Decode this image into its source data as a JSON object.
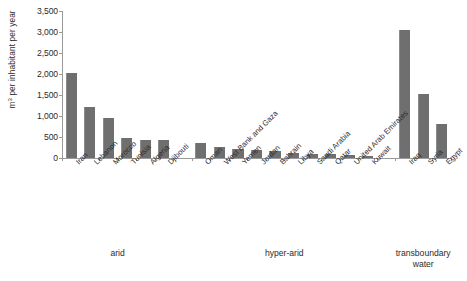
{
  "chart_data": {
    "type": "bar",
    "title": "",
    "xlabel": "",
    "ylabel": "m3 per inhabitant per year",
    "ylabel_html": "m³ per inhabitant per year",
    "ylim": [
      0,
      3500
    ],
    "ytick_step": 500,
    "ytick_labels": [
      "3,500",
      "3,000",
      "2,500",
      "2,000",
      "1,500",
      "1,000",
      "500",
      "0"
    ],
    "ytick_values": [
      3500,
      3000,
      2500,
      2000,
      1500,
      1000,
      500,
      0
    ],
    "grid": false,
    "legend": "none",
    "bar_color": "#6f6f6f",
    "axis_color": "#9a9a9a",
    "categories": [
      "Iran",
      "Lebanon",
      "Morocco",
      "Tunisia",
      "Algeria",
      "Djibouti",
      "Oman",
      "West Bank and Gaza",
      "Yemen",
      "Jordan",
      "Bahrain",
      "Libya",
      "Saudi Arabia",
      "Qatar",
      "United Arab Emirates",
      "Kuwait",
      "Iraq",
      "Syria",
      "Egypt"
    ],
    "values": [
      2020,
      1220,
      960,
      480,
      440,
      430,
      360,
      255,
      215,
      195,
      165,
      130,
      95,
      85,
      70,
      40,
      3050,
      1520,
      820
    ],
    "groups": [
      {
        "label": "arid",
        "categories": [
          "Iran",
          "Lebanon",
          "Morocco",
          "Tunisia",
          "Algeria",
          "Djibouti"
        ]
      },
      {
        "label": "hyper-arid",
        "categories": [
          "Oman",
          "West Bank and Gaza",
          "Yemen",
          "Jordan",
          "Bahrain",
          "Libya",
          "Saudi Arabia",
          "Qatar",
          "United Arab Emirates",
          "Kuwait"
        ]
      },
      {
        "label": "transboundary\nwater",
        "categories": [
          "Iraq",
          "Syria",
          "Egypt"
        ]
      }
    ],
    "group_labels": [
      "arid",
      "hyper-arid",
      "transboundary\nwater"
    ]
  }
}
